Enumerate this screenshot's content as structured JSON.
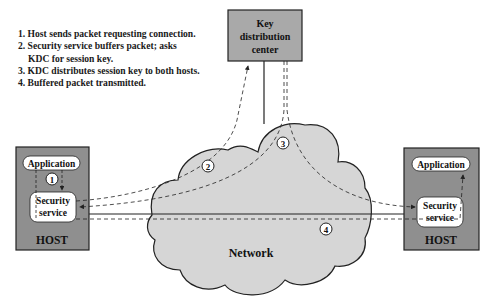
{
  "steps": [
    {
      "num": "1.",
      "text": "Host sends packet requesting connection."
    },
    {
      "num": "2.",
      "text": "Security service buffers packet; asks",
      "cont": "KDC for session key."
    },
    {
      "num": "3.",
      "text": "KDC distributes session key to both hosts."
    },
    {
      "num": "4.",
      "text": "Buffered packet transmitted."
    }
  ],
  "kdc": {
    "line1": "Key",
    "line2": "distribution",
    "line3": "center"
  },
  "network": {
    "label": "Network"
  },
  "left_host": {
    "label": "HOST",
    "application": "Application",
    "security_line1": "Security",
    "security_line2": "service"
  },
  "right_host": {
    "label": "HOST",
    "application": "Application",
    "security_line1": "Security",
    "security_line2": "service"
  },
  "markers": [
    "1",
    "2",
    "3",
    "4"
  ],
  "colors": {
    "host_fill": "#8f8f8f",
    "kdc_fill": "#a9a9a9",
    "cloud_fill": "#d6d6d6",
    "stroke": "#222222"
  }
}
